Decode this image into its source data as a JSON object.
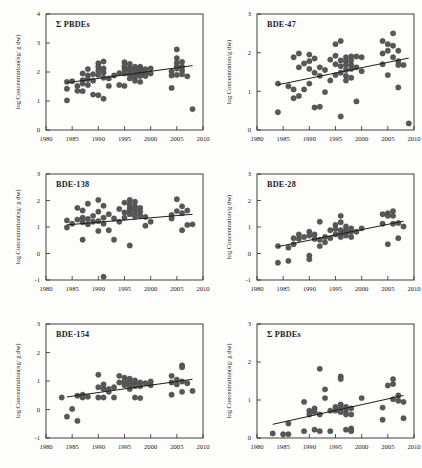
{
  "figure": {
    "name": "pbde-congener-temporal-trends",
    "panel_count": 6,
    "marker_color": "#585858",
    "trend_color": "#1c1c1c",
    "axis_color": "#2a2a2a",
    "background": "#fdfdfb"
  },
  "chart_data": [
    {
      "type": "scatter",
      "title": "Σ PBDEs",
      "xlabel": "",
      "ylabel": "log Concentration(ng/ g dw)",
      "xlim": [
        1980,
        2010
      ],
      "ylim": [
        0,
        4
      ],
      "xticks": [
        1980,
        1985,
        1990,
        1995,
        2000,
        2005,
        2010
      ],
      "yticks": [
        0,
        1,
        2,
        3,
        4
      ],
      "grid": false,
      "trend": {
        "x": [
          1984,
          2008
        ],
        "y": [
          1.63,
          2.22
        ]
      },
      "x": [
        1984,
        1984,
        1984,
        1985,
        1986,
        1986,
        1987,
        1987,
        1987,
        1987,
        1988,
        1988,
        1988,
        1988,
        1989,
        1989,
        1989,
        1990,
        1990,
        1990,
        1990,
        1990,
        1991,
        1991,
        1991,
        1991,
        1991,
        1992,
        1992,
        1993,
        1994,
        1994,
        1995,
        1995,
        1995,
        1995,
        1995,
        1996,
        1996,
        1996,
        1996,
        1996,
        1997,
        1997,
        1997,
        1997,
        1997,
        1997,
        1998,
        1998,
        1998,
        1998,
        1998,
        1998,
        1999,
        1999,
        1999,
        2000,
        2000,
        2004,
        2004,
        2004,
        2005,
        2005,
        2005,
        2005,
        2005,
        2005,
        2006,
        2006,
        2006,
        2006,
        2007,
        2008
      ],
      "y": [
        1.66,
        1.42,
        1.02,
        1.68,
        1.52,
        1.35,
        1.95,
        1.72,
        1.6,
        1.34,
        2.1,
        1.88,
        1.75,
        1.55,
        1.92,
        1.7,
        1.22,
        2.3,
        2.18,
        2.05,
        1.9,
        1.2,
        2.36,
        2.12,
        1.98,
        1.8,
        1.08,
        1.78,
        1.52,
        1.88,
        1.96,
        1.55,
        2.34,
        2.2,
        2.08,
        1.95,
        1.52,
        2.28,
        2.12,
        2.05,
        1.92,
        1.78,
        2.18,
        2.08,
        1.98,
        1.9,
        1.82,
        1.7,
        2.18,
        2.1,
        2.02,
        1.94,
        1.86,
        1.66,
        2.1,
        1.98,
        1.86,
        2.12,
        1.95,
        2.02,
        1.88,
        1.45,
        2.78,
        2.48,
        2.32,
        2.2,
        2.12,
        1.9,
        2.35,
        2.18,
        2.05,
        1.92,
        1.85,
        0.72
      ]
    },
    {
      "type": "scatter",
      "title": "BDE-47",
      "xlabel": "",
      "ylabel": "log Concentration/g dw)",
      "xlim": [
        1980,
        2010
      ],
      "ylim": [
        0,
        3
      ],
      "xticks": [
        1980,
        1985,
        1990,
        1995,
        2000,
        2005,
        2010
      ],
      "yticks": [
        0,
        1,
        2,
        3
      ],
      "grid": false,
      "trend": {
        "x": [
          1984,
          2009
        ],
        "y": [
          1.17,
          1.86
        ]
      },
      "x": [
        1984,
        1984,
        1986,
        1987,
        1987,
        1987,
        1988,
        1988,
        1988,
        1989,
        1989,
        1990,
        1990,
        1990,
        1990,
        1991,
        1991,
        1991,
        1992,
        1992,
        1992,
        1993,
        1993,
        1994,
        1994,
        1995,
        1995,
        1995,
        1995,
        1996,
        1996,
        1996,
        1996,
        1996,
        1997,
        1997,
        1997,
        1997,
        1997,
        1997,
        1998,
        1998,
        1998,
        1998,
        1998,
        1999,
        1999,
        1999,
        2000,
        2000,
        2004,
        2004,
        2004,
        2005,
        2005,
        2005,
        2006,
        2006,
        2006,
        2007,
        2007,
        2007,
        2007,
        2008,
        2009
      ],
      "y": [
        1.2,
        0.46,
        1.13,
        1.88,
        1.05,
        0.82,
        1.98,
        1.62,
        0.88,
        1.72,
        1.05,
        1.95,
        1.78,
        1.58,
        1.2,
        1.85,
        1.48,
        0.58,
        1.62,
        1.4,
        0.6,
        1.55,
        0.98,
        1.82,
        1.28,
        2.22,
        1.92,
        1.7,
        1.42,
        2.3,
        1.8,
        1.65,
        1.48,
        0.35,
        1.88,
        1.78,
        1.68,
        1.55,
        1.4,
        1.28,
        1.9,
        1.8,
        1.68,
        1.58,
        1.35,
        1.9,
        1.62,
        0.74,
        1.88,
        1.52,
        2.3,
        1.98,
        1.7,
        2.22,
        2.05,
        1.42,
        2.5,
        2.18,
        1.88,
        2.05,
        1.78,
        1.68,
        1.1,
        1.68,
        0.17
      ]
    },
    {
      "type": "scatter",
      "title": "BDE-138",
      "xlabel": "",
      "ylabel": "log Concentration(ng/ g dw)",
      "xlim": [
        1980,
        2010
      ],
      "ylim": [
        -1,
        3
      ],
      "xticks": [
        1980,
        1985,
        1990,
        1995,
        2000,
        2005,
        2010
      ],
      "yticks": [
        -1,
        0,
        1,
        2,
        3
      ],
      "grid": false,
      "trend": {
        "x": [
          1984,
          2008
        ],
        "y": [
          1.08,
          1.48
        ]
      },
      "x": [
        1984,
        1984,
        1985,
        1986,
        1986,
        1987,
        1987,
        1987,
        1987,
        1988,
        1988,
        1988,
        1989,
        1989,
        1990,
        1990,
        1990,
        1990,
        1991,
        1991,
        1991,
        1991,
        1992,
        1992,
        1993,
        1993,
        1994,
        1994,
        1995,
        1995,
        1995,
        1996,
        1996,
        1996,
        1996,
        1996,
        1996,
        1997,
        1997,
        1997,
        1997,
        1997,
        1998,
        1998,
        1998,
        1999,
        1999,
        2000,
        2004,
        2004,
        2005,
        2005,
        2006,
        2006,
        2006,
        2007,
        2007,
        2008
      ],
      "y": [
        1.25,
        0.98,
        1.12,
        1.72,
        1.28,
        1.62,
        1.35,
        1.18,
        0.52,
        1.88,
        1.3,
        1.1,
        1.42,
        1.2,
        2.02,
        1.58,
        1.22,
        0.85,
        1.8,
        1.35,
        1.12,
        -0.88,
        1.48,
        0.88,
        1.32,
        0.52,
        1.68,
        1.2,
        1.92,
        1.55,
        1.35,
        2.02,
        1.85,
        1.72,
        1.62,
        1.48,
        0.3,
        1.95,
        1.78,
        1.65,
        1.52,
        1.4,
        1.72,
        1.58,
        1.42,
        1.38,
        1.05,
        1.2,
        1.45,
        1.32,
        2.05,
        1.6,
        1.78,
        1.52,
        0.88,
        1.62,
        1.08,
        1.1
      ]
    },
    {
      "type": "scatter",
      "title": "BDE-28",
      "xlabel": "",
      "ylabel": "log Concentration/g dw)",
      "xlim": [
        1980,
        2010
      ],
      "ylim": [
        -1,
        3
      ],
      "xticks": [
        1980,
        1985,
        1990,
        1995,
        2000,
        2005,
        2010
      ],
      "yticks": [
        -1,
        0,
        1,
        2,
        3
      ],
      "grid": false,
      "trend": {
        "x": [
          1984,
          2008
        ],
        "y": [
          0.26,
          1.22
        ]
      },
      "x": [
        1984,
        1984,
        1986,
        1986,
        1987,
        1987,
        1988,
        1988,
        1989,
        1990,
        1990,
        1990,
        1990,
        1991,
        1991,
        1992,
        1992,
        1992,
        1993,
        1993,
        1994,
        1994,
        1995,
        1995,
        1995,
        1996,
        1996,
        1996,
        1996,
        1996,
        1997,
        1997,
        1997,
        1997,
        1998,
        1998,
        1998,
        1999,
        2000,
        2004,
        2004,
        2005,
        2005,
        2005,
        2006,
        2006,
        2006,
        2007,
        2007,
        2008
      ],
      "y": [
        0.28,
        -0.35,
        0.22,
        -0.28,
        0.58,
        0.35,
        0.72,
        0.55,
        0.62,
        0.82,
        0.68,
        -0.08,
        -0.22,
        0.72,
        0.55,
        1.2,
        0.52,
        0.28,
        0.62,
        0.42,
        0.88,
        0.58,
        1.08,
        0.92,
        0.72,
        1.42,
        1.18,
        0.88,
        0.75,
        0.62,
        1.02,
        0.88,
        0.78,
        0.68,
        0.95,
        0.82,
        0.62,
        0.82,
        0.95,
        1.48,
        1.12,
        1.52,
        1.42,
        0.35,
        1.6,
        1.42,
        1.12,
        1.15,
        0.58,
        1.02
      ]
    },
    {
      "type": "scatter",
      "title": "BDE-154",
      "xlabel": "",
      "ylabel": "log Concentration(ng/ g dw)",
      "xlim": [
        1980,
        2010
      ],
      "ylim": [
        -1,
        3
      ],
      "xticks": [
        1980,
        1985,
        1990,
        1995,
        2000,
        2005,
        2010
      ],
      "yticks": [
        -1,
        0,
        1,
        2,
        3
      ],
      "grid": false,
      "trend": {
        "x": [
          1984,
          2008
        ],
        "y": [
          0.44,
          1.06
        ]
      },
      "x": [
        1983,
        1984,
        1985,
        1986,
        1986,
        1987,
        1987,
        1988,
        1990,
        1990,
        1990,
        1991,
        1991,
        1991,
        1992,
        1992,
        1993,
        1993,
        1994,
        1994,
        1995,
        1995,
        1995,
        1996,
        1996,
        1996,
        1996,
        1997,
        1997,
        1997,
        1997,
        1998,
        1998,
        1998,
        1999,
        2000,
        2000,
        2004,
        2004,
        2004,
        2005,
        2005,
        2006,
        2006,
        2006,
        2006,
        2007,
        2008
      ],
      "y": [
        0.42,
        -0.25,
        0.02,
        0.48,
        -0.4,
        0.52,
        0.42,
        0.45,
        1.22,
        0.78,
        0.42,
        0.88,
        0.72,
        0.42,
        0.72,
        0.62,
        0.78,
        0.42,
        1.18,
        0.95,
        1.12,
        0.98,
        0.85,
        1.08,
        0.95,
        0.85,
        0.72,
        1.02,
        0.92,
        0.82,
        0.42,
        0.95,
        0.82,
        0.4,
        0.92,
        0.98,
        0.85,
        1.18,
        0.95,
        0.52,
        1.05,
        0.88,
        1.55,
        1.48,
        0.98,
        0.62,
        0.92,
        0.65
      ]
    },
    {
      "type": "scatter",
      "title": "Σ PBDEs",
      "xlabel": "",
      "ylabel": "log Concentration(ng/ g dw)",
      "xlim": [
        1980,
        2010
      ],
      "ylim": [
        0,
        3
      ],
      "xticks": [
        1980,
        1985,
        1990,
        1995,
        2000,
        2005,
        2010
      ],
      "yticks": [
        0,
        1,
        2,
        3
      ],
      "grid": false,
      "trend": {
        "x": [
          1983,
          2008
        ],
        "y": [
          0.36,
          1.12
        ]
      },
      "x": [
        1983,
        1985,
        1986,
        1986,
        1989,
        1989,
        1990,
        1990,
        1991,
        1991,
        1991,
        1992,
        1992,
        1992,
        1993,
        1993,
        1994,
        1994,
        1995,
        1995,
        1996,
        1996,
        1996,
        1996,
        1996,
        1997,
        1997,
        1997,
        1997,
        1998,
        1998,
        1998,
        1998,
        2000,
        2004,
        2004,
        2005,
        2006,
        2006,
        2006,
        2007,
        2007,
        2008,
        2008
      ],
      "y": [
        0.12,
        0.1,
        0.38,
        0.1,
        0.95,
        0.18,
        0.72,
        0.62,
        0.78,
        0.68,
        0.22,
        1.82,
        0.62,
        0.18,
        1.28,
        1.05,
        0.72,
        0.18,
        0.82,
        0.72,
        1.62,
        1.55,
        0.88,
        0.78,
        0.68,
        0.82,
        0.72,
        0.62,
        0.22,
        0.78,
        0.62,
        0.25,
        0.18,
        1.05,
        0.48,
        0.8,
        1.38,
        1.55,
        1.42,
        1.02,
        1.12,
        0.98,
        0.95,
        0.52
      ]
    }
  ]
}
